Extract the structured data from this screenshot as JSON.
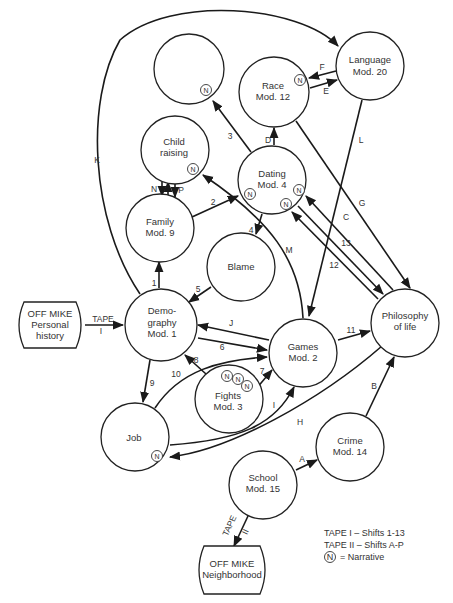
{
  "diagram": {
    "nodes": {
      "empty_top": {
        "label1": "",
        "label2": ""
      },
      "language": {
        "label1": "Language",
        "label2": "Mod. 20"
      },
      "race": {
        "label1": "Race",
        "label2": "Mod. 12"
      },
      "child_raising": {
        "label1": "Child",
        "label2": "raising"
      },
      "dating": {
        "label1": "Dating",
        "label2": "Mod. 4"
      },
      "family": {
        "label1": "Family",
        "label2": "Mod. 9"
      },
      "blame": {
        "label1": "Blame"
      },
      "demography": {
        "label1": "Demo-",
        "label2": "graphy",
        "label3": "Mod. 1"
      },
      "games": {
        "label1": "Games",
        "label2": "Mod. 2"
      },
      "philosophy": {
        "label1": "Philosophy",
        "label2": "of life"
      },
      "fights": {
        "label1": "Fights",
        "label2": "Mod. 3"
      },
      "job": {
        "label1": "Job"
      },
      "crime": {
        "label1": "Crime",
        "label2": "Mod. 14"
      },
      "school": {
        "label1": "School",
        "label2": "Mod. 15"
      },
      "offmike_personal": {
        "label1": "OFF MIKE",
        "label2": "Personal",
        "label3": "history"
      },
      "offmike_neighborhood": {
        "label1": "OFF MIKE",
        "label2": "Neighborhood"
      }
    },
    "narrative_marker": "N",
    "edges": {
      "tape1": {
        "label": "TAPE",
        "sub": "I"
      },
      "tape2": {
        "label": "TAPE",
        "sub": "II"
      },
      "e1": "1",
      "e2": "2",
      "e3": "3",
      "e4": "4",
      "e5": "5",
      "e6": "6",
      "e7": "7",
      "e8": "8",
      "e9": "9",
      "e10": "10",
      "e11": "11",
      "e12": "12",
      "e13": "13",
      "eA": "A",
      "eB": "B",
      "eC": "C",
      "eD": "D",
      "eE": "E",
      "eF": "F",
      "eG": "G",
      "eH": "H",
      "eI": "I",
      "eJ": "J",
      "eK": "K",
      "eL": "L",
      "eM": "M",
      "eN": "N",
      "eO": "O",
      "eP": "P"
    },
    "legend": {
      "line1": "TAPE I – Shifts 1-13",
      "line2": "TAPE II – Shifts A-P",
      "narrative": "= Narrative"
    }
  }
}
